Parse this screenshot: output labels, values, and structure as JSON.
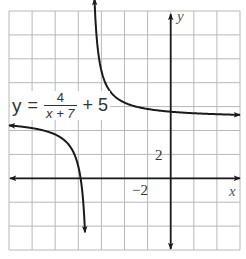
{
  "chart_data": {
    "type": "line",
    "title": "",
    "equation": {
      "lhs": "y",
      "eq": "=",
      "numerator": "4",
      "denominator": "x + 7",
      "tail": "+ 5"
    },
    "function": {
      "a": 4,
      "h": -7,
      "k": 5
    },
    "asymptotes": {
      "vertical": -7,
      "horizontal": 5
    },
    "xlabel": "x",
    "ylabel": "y",
    "xlim": [
      -14,
      6
    ],
    "ylim": [
      -6,
      14
    ],
    "grid_step": 2,
    "grid": true,
    "tick_labels": {
      "x": [
        {
          "value": -2,
          "label": "−2"
        }
      ],
      "y": [
        {
          "value": 2,
          "label": "2"
        }
      ]
    },
    "series": [
      {
        "name": "left branch",
        "x_range": [
          -14,
          -7
        ],
        "sample_points": [
          [
            -14,
            4.43
          ],
          [
            -11,
            4
          ],
          [
            -9,
            3
          ],
          [
            -8,
            1
          ],
          [
            -7.5,
            -3
          ],
          [
            -7.4,
            -5
          ]
        ]
      },
      {
        "name": "right branch",
        "x_range": [
          -7,
          6
        ],
        "sample_points": [
          [
            -6.7,
            18.3
          ],
          [
            -6,
            9
          ],
          [
            -5,
            7
          ],
          [
            -3,
            6
          ],
          [
            0,
            5.57
          ],
          [
            6,
            5.31
          ]
        ]
      }
    ]
  },
  "labels": {
    "x_axis": "x",
    "y_axis": "y",
    "tick_x": "−2",
    "tick_y": "2"
  },
  "colors": {
    "grid": "#b8b8b8",
    "axis": "#1a1a1a",
    "curve": "#1a1a1a"
  }
}
